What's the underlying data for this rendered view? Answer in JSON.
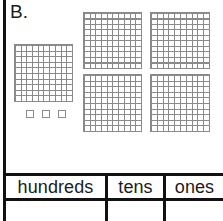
{
  "worksheet": {
    "problem_letter": "B.",
    "grid_line_color": "#8a8a8a",
    "rule_color": "#111111",
    "background_color": "#ffffff"
  },
  "blocks": {
    "hundreds_flats": [
      {
        "name": "flat-left",
        "rows": 10,
        "cols": 10,
        "value": 100,
        "x": 14,
        "y": 44,
        "w": 59,
        "h": 58
      },
      {
        "name": "flat-top-left",
        "rows": 10,
        "cols": 10,
        "value": 100,
        "x": 83,
        "y": 12,
        "w": 59,
        "h": 57
      },
      {
        "name": "flat-top-right",
        "rows": 10,
        "cols": 10,
        "value": 100,
        "x": 150,
        "y": 12,
        "w": 60,
        "h": 57
      },
      {
        "name": "flat-bottom-left",
        "rows": 10,
        "cols": 10,
        "value": 100,
        "x": 83,
        "y": 74,
        "w": 59,
        "h": 58
      },
      {
        "name": "flat-bottom-right",
        "rows": 10,
        "cols": 10,
        "value": 100,
        "x": 150,
        "y": 74,
        "w": 60,
        "h": 58
      }
    ],
    "ones_cubes": [
      {
        "name": "unit-cube-1",
        "value": 1,
        "x": 26,
        "y": 110
      },
      {
        "name": "unit-cube-2",
        "value": 1,
        "x": 42,
        "y": 110
      },
      {
        "name": "unit-cube-3",
        "value": 1,
        "x": 58,
        "y": 110
      }
    ],
    "counts": {
      "hundreds": 5,
      "tens": 0,
      "ones": 3
    }
  },
  "place_value_table": {
    "headers": {
      "hundreds": "hundreds",
      "tens": "tens",
      "ones": "ones"
    },
    "answer_row": {
      "hundreds": "",
      "tens": "",
      "ones": ""
    }
  }
}
